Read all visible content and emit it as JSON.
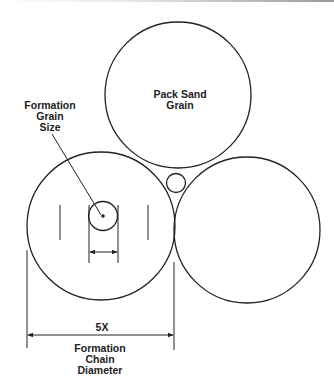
{
  "labels": {
    "pack_sand": [
      "Pack Sand",
      "Grain"
    ],
    "formation_grain": [
      "Formation",
      "Grain",
      "Size"
    ],
    "multiplier": "5X",
    "chain_diameter": [
      "Formation",
      "Chain",
      "Diameter"
    ]
  },
  "colors": {
    "stroke": "#222222",
    "background": "#ffffff"
  }
}
